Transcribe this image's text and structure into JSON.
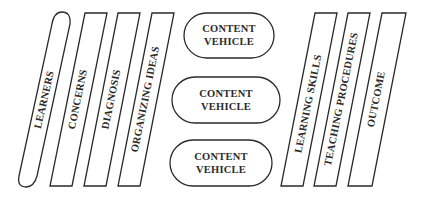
{
  "diagram": {
    "left_columns": [
      {
        "label": "LEARNERS",
        "shape": "rounded-slanted-pill"
      },
      {
        "label": "CONCERNS",
        "shape": "parallelogram"
      },
      {
        "label": "DIAGNOSIS",
        "shape": "parallelogram"
      },
      {
        "label": "ORGANIZING IDEAS",
        "shape": "parallelogram"
      }
    ],
    "center_nodes": [
      {
        "line1": "CONTENT",
        "line2": "VEHICLE"
      },
      {
        "line1": "CONTENT",
        "line2": "VEHICLE"
      },
      {
        "line1": "CONTENT",
        "line2": "VEHICLE"
      }
    ],
    "right_columns": [
      {
        "label": "LEARNING SKILLS",
        "shape": "parallelogram"
      },
      {
        "label": "TEACHING PROCEDURES",
        "shape": "parallelogram"
      },
      {
        "label": "OUTCOME",
        "shape": "parallelogram"
      }
    ],
    "colors": {
      "stroke": "#2a2a2a",
      "fill": "#ffffff",
      "text": "#2a2a2a"
    }
  }
}
